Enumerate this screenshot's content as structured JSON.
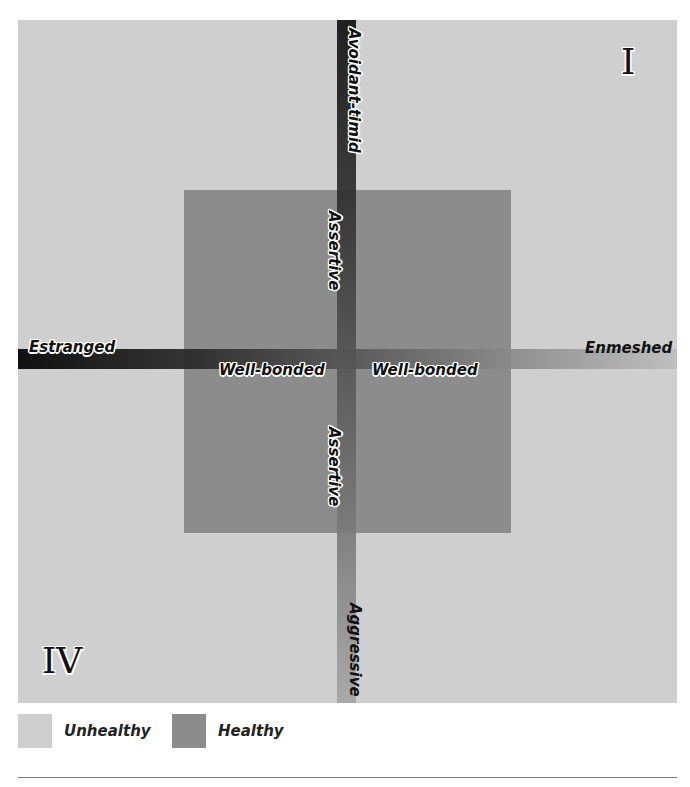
{
  "diagram": {
    "quadrants": {
      "top_right": "I",
      "bottom_left": "IV"
    },
    "axes": {
      "vertical": {
        "top_label": "Avoidant-timid",
        "upper_center_label": "Assertive",
        "lower_center_label": "Assertive",
        "bottom_label": "Aggressive"
      },
      "horizontal": {
        "left_label": "Estranged",
        "left_center_label": "Well-bonded",
        "right_center_label": "Well-bonded",
        "right_label": "Enmeshed"
      }
    },
    "colors": {
      "unhealthy": "#cfcfcf",
      "healthy": "#8c8c8c",
      "axis_dark": "#000000",
      "axis_light": "#bdbdbd"
    }
  },
  "legend": {
    "items": [
      {
        "label": "Unhealthy",
        "color": "#cfcfcf"
      },
      {
        "label": "Healthy",
        "color": "#8c8c8c"
      }
    ]
  }
}
